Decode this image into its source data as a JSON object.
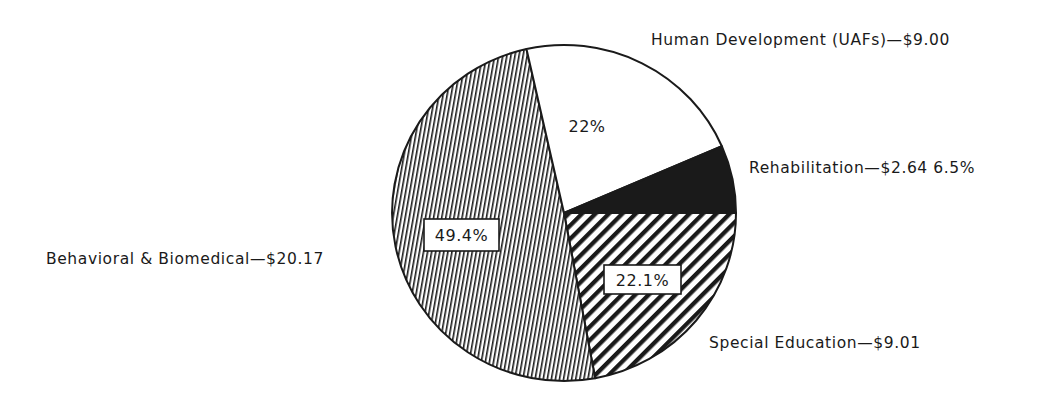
{
  "chart_data": {
    "type": "pie",
    "title": "",
    "categories": [
      "Special Education",
      "Behavioral & Biomedical",
      "Human Development (UAFs)",
      "Rehabilitation"
    ],
    "values": [
      9.01,
      20.17,
      9.0,
      2.64
    ],
    "percentages": [
      22.1,
      49.4,
      22.0,
      6.5
    ],
    "value_unit": "$",
    "fills": [
      "diagonal-hatch",
      "fine-vertical-hatch",
      "white",
      "black"
    ],
    "start_angle_deg": 0,
    "direction": "clockwise",
    "legend": "none (direct labels)"
  },
  "labels": {
    "human_dev": "Human Development (UAFs)—$9.00",
    "rehab": "Rehabilitation—$2.64  6.5%",
    "special_ed": "Special Education—$9.01",
    "behavioral": "Behavioral & Biomedical—$20.17"
  },
  "pct_labels": {
    "human_dev": "22%",
    "behavioral": "49.4%",
    "special_ed": "22.1%"
  },
  "colors": {
    "ink": "#1a1a1a",
    "background": "#ffffff"
  }
}
